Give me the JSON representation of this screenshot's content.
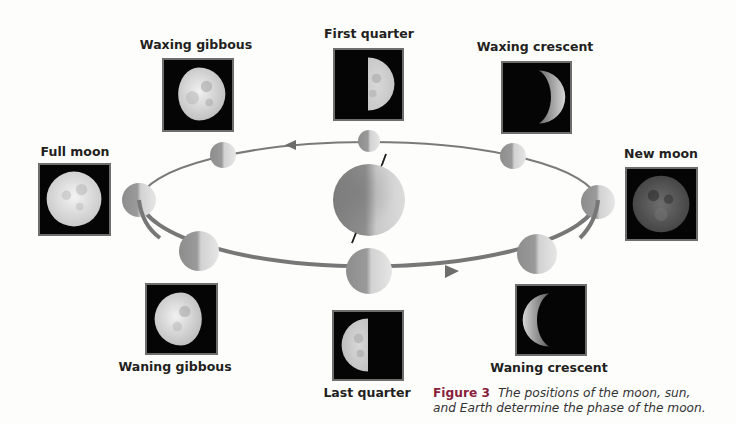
{
  "figure": {
    "caption_label": "Figure 3",
    "caption_line1": "The positions of the moon, sun,",
    "caption_line2": "and Earth determine the phase of the moon."
  },
  "phases": [
    {
      "id": "waxing-gibbous",
      "label": "Waxing gibbous"
    },
    {
      "id": "first-quarter",
      "label": "First quarter"
    },
    {
      "id": "waxing-crescent",
      "label": "Waxing crescent"
    },
    {
      "id": "full-moon",
      "label": "Full moon"
    },
    {
      "id": "new-moon",
      "label": "New moon"
    },
    {
      "id": "waning-gibbous",
      "label": "Waning gibbous"
    },
    {
      "id": "last-quarter",
      "label": "Last quarter"
    },
    {
      "id": "waning-crescent",
      "label": "Waning crescent"
    }
  ],
  "diagram": {
    "center_body": "Earth",
    "orbit_direction": "counterclockwise",
    "orbit_moon_count": 8
  },
  "colors": {
    "background": "#fdfdfc",
    "photo_bg": "#050505",
    "photo_border": "#6e6e6e",
    "orbit_line": "#7a7a7a",
    "label_text": "#231f20",
    "figure_label": "#8a1f3c"
  }
}
